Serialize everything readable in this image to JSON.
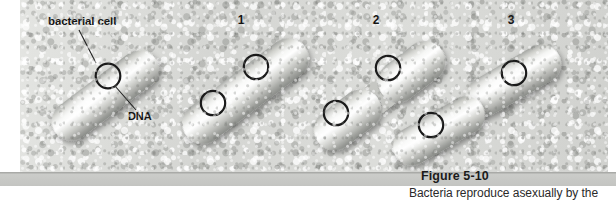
{
  "figure": {
    "number_label": "Figure 5-10",
    "caption_text": "Bacteria reproduce asexually by the",
    "labels": {
      "bacterial_cell": "bacterial cell",
      "dna": "DNA"
    },
    "stage_numbers": [
      "1",
      "2",
      "3"
    ],
    "colors": {
      "background_texture": "#d8d9d6",
      "caption_bar": "#c3c4c1",
      "caption_bar_top_rule": "#a9aaa7",
      "cell_body_light": "#f2f3f1",
      "cell_body_mid": "#c9cac7",
      "cell_body_shadow": "#8e908c",
      "dna_ring": "#1a1a1a",
      "label_text": "#141414",
      "leader_line": "#1f1f1f"
    }
  },
  "diagram": {
    "title_implied": "Binary fission in a bacterial cell",
    "stages": [
      {
        "stage": "parent",
        "label": "bacterial cell",
        "cell_count": 1,
        "dna_count": 1,
        "description": "Single rod-shaped (capsule) bacterial cell with one circular DNA molecule"
      },
      {
        "stage": "1",
        "cell_count": 1,
        "dna_count": 2,
        "description": "DNA has replicated; elongated cell contains two circular DNA molecules at opposite ends"
      },
      {
        "stage": "2",
        "cell_count": 1,
        "dna_count": 2,
        "description": "Cell membrane pinches inward at the midpoint, constricting into two lobes each with one DNA molecule"
      },
      {
        "stage": "3",
        "cell_count": 2,
        "dna_count": 2,
        "description": "Two separate identical daughter cells, each with one circular DNA molecule"
      }
    ]
  }
}
